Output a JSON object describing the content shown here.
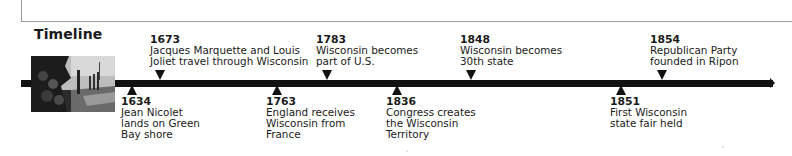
{
  "heading": "Timeline",
  "image": {
    "alt": "historical-illustration-explorers-landing",
    "icon": "photo"
  },
  "colors": {
    "bar": "#111111",
    "text": "#1a1a1a",
    "border": "#9a9a9a"
  },
  "events_above": [
    {
      "year": "1673",
      "lines": [
        "Jacques Marquette and Louis",
        "Joliet travel through Wisconsin"
      ]
    },
    {
      "year": "1783",
      "lines": [
        "Wisconsin becomes",
        "part of U.S."
      ]
    },
    {
      "year": "1848",
      "lines": [
        "Wisconsin becomes",
        "30th state"
      ]
    },
    {
      "year": "1854",
      "lines": [
        "Republican Party",
        "founded in Ripon"
      ]
    }
  ],
  "events_below": [
    {
      "year": "1634",
      "lines": [
        "Jean Nicolet",
        "lands on Green",
        "Bay shore"
      ]
    },
    {
      "year": "1763",
      "lines": [
        "England receives",
        "Wisconsin from",
        "France"
      ]
    },
    {
      "year": "1836",
      "lines": [
        "Congress creates",
        "the Wisconsin",
        "Territory"
      ]
    },
    {
      "year": "1851",
      "lines": [
        "First Wisconsin",
        "state fair held"
      ]
    }
  ]
}
